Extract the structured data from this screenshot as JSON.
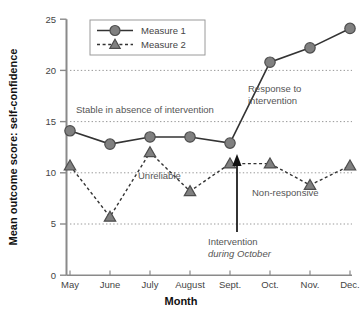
{
  "chart_data": {
    "type": "line",
    "title": "",
    "xlabel": "Month",
    "ylabel": "Mean outcome score: self-confidence",
    "categories": [
      "May",
      "June",
      "July",
      "August",
      "Sept.",
      "Oct.",
      "Nov.",
      "Dec."
    ],
    "ylim": [
      0,
      25
    ],
    "yticks": [
      0,
      5,
      10,
      15,
      20,
      25
    ],
    "grid": "horizontal dotted gridlines at 5, 10, 15, 20",
    "legend_position": "top-left inside plot",
    "series": [
      {
        "name": "Measure 1",
        "marker": "circle",
        "line_style": "solid",
        "values": [
          14.1,
          12.8,
          13.5,
          13.5,
          12.9,
          20.8,
          22.2,
          24.1
        ]
      },
      {
        "name": "Measure 2",
        "marker": "triangle",
        "line_style": "dashed",
        "values": [
          10.7,
          5.7,
          12.0,
          8.2,
          10.9,
          10.9,
          8.8,
          10.7
        ]
      }
    ],
    "annotations": [
      {
        "id": "stable",
        "text": "Stable in absence of intervention"
      },
      {
        "id": "response",
        "line1": "Response to",
        "line2": "intervention"
      },
      {
        "id": "unreliable",
        "text": "Unreliable"
      },
      {
        "id": "nonresponsive",
        "text": "Non-responsive"
      },
      {
        "id": "intervention",
        "line1": "Intervention",
        "line2": "during October"
      }
    ],
    "colors": {
      "series1": "#808080",
      "series2": "#808080",
      "line": "#333333",
      "grid": "#999999",
      "axis": "#888888",
      "arrow": "#111111",
      "text": "#555555"
    }
  },
  "yticks": {
    "t0": "0",
    "t5": "5",
    "t10": "10",
    "t15": "15",
    "t20": "20",
    "t25": "25"
  },
  "xticks": {
    "m0": "May",
    "m1": "June",
    "m2": "July",
    "m3": "August",
    "m4": "Sept.",
    "m5": "Oct.",
    "m6": "Nov.",
    "m7": "Dec."
  },
  "axis_titles": {
    "x": "Month",
    "y": "Mean outcome score: self-confidence"
  },
  "legend": {
    "item1": "Measure 1",
    "item2": "Measure 2"
  },
  "annotations": {
    "stable": "Stable in absence of intervention",
    "response_line1": "Response to",
    "response_line2": "intervention",
    "unreliable": "Unreliable",
    "nonresponsive": "Non-responsive",
    "intervention_line1": "Intervention",
    "intervention_line2": "during October"
  }
}
